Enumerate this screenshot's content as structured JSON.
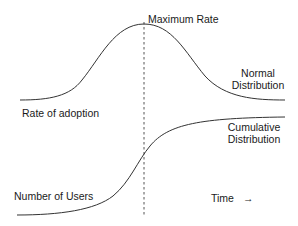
{
  "diagram": {
    "top_curve": {
      "type": "normal-distribution",
      "label_left": "Rate of adoption",
      "label_right_line1": "Normal",
      "label_right_line2": "Distribution",
      "peak_label": "Maximum Rate"
    },
    "bottom_curve": {
      "type": "cumulative-distribution",
      "label_left": "Number of Users",
      "label_right_line1": "Cumulative",
      "label_right_line2": "Distribution"
    },
    "axis": {
      "time_label": "Time",
      "time_arrow": "→"
    },
    "colors": {
      "line": "#333333",
      "background": "#ffffff",
      "text": "#1a1a1a"
    }
  }
}
